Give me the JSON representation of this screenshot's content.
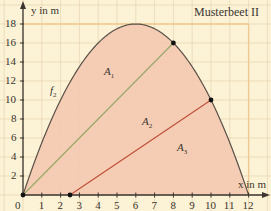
{
  "chart_data": {
    "type": "line",
    "title": "Musterbeet II",
    "xlabel": "x in m",
    "ylabel": "y in m",
    "xlim": [
      0,
      12
    ],
    "ylim": [
      0,
      18
    ],
    "x_ticks": [
      0,
      1,
      2,
      3,
      4,
      5,
      6,
      7,
      8,
      9,
      10,
      11,
      12
    ],
    "y_ticks": [
      2,
      4,
      6,
      8,
      10,
      12,
      14,
      16,
      18
    ],
    "grid": true,
    "series": [
      {
        "name": "f2",
        "kind": "curve",
        "formula": "-0.5x^2 + 6x",
        "x": [
          0,
          2,
          4,
          6,
          8,
          10,
          12
        ],
        "y": [
          0,
          10,
          16,
          18,
          16,
          10,
          0
        ],
        "color": "#5a5048"
      },
      {
        "name": "line_green",
        "kind": "segment",
        "x": [
          0,
          8
        ],
        "y": [
          0,
          16
        ],
        "color": "#9aa86a"
      },
      {
        "name": "line_red",
        "kind": "segment",
        "x": [
          2.5,
          10
        ],
        "y": [
          0,
          10
        ],
        "color": "#c0503a"
      }
    ],
    "points": [
      {
        "x": 0,
        "y": 0
      },
      {
        "x": 2.5,
        "y": 0
      },
      {
        "x": 8,
        "y": 16
      },
      {
        "x": 10,
        "y": 10
      }
    ],
    "regions": [
      {
        "label": "A1",
        "x": 5.5,
        "y": 12.5
      },
      {
        "label": "A2",
        "x": 6.6,
        "y": 8
      },
      {
        "label": "A3",
        "x": 8.2,
        "y": 4.2
      }
    ],
    "annotations": [
      {
        "text": "f2",
        "x": 1.4,
        "y": 9.5
      },
      {
        "text": "Musterbeet II",
        "position": "top-right"
      }
    ],
    "boundary": {
      "x_max": 12,
      "y_max": 18,
      "color": "#f0c890"
    },
    "fill_color": "#f4c9b0"
  },
  "labels": {
    "title": "Musterbeet II",
    "xlabel": "x in m",
    "ylabel": "y in m",
    "f2": "f",
    "f2_sub": "2",
    "A1": "A",
    "A1_sub": "1",
    "A2": "A",
    "A2_sub": "2",
    "A3": "A",
    "A3_sub": "3",
    "x_ticks": [
      "0",
      "1",
      "2",
      "3",
      "4",
      "5",
      "6",
      "7",
      "8",
      "9",
      "10",
      "11",
      "12"
    ],
    "y_ticks": [
      "2",
      "4",
      "6",
      "8",
      "10",
      "12",
      "14",
      "16",
      "18"
    ]
  }
}
